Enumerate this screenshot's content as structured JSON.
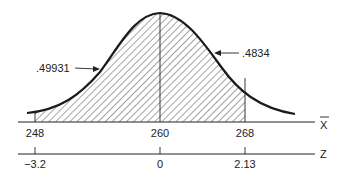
{
  "diagram": {
    "type": "normal-distribution",
    "curve_color": "#1a1a1a",
    "hatch_color": "#333333",
    "annotations": {
      "left_area": ".49931",
      "right_area": ".4834"
    },
    "x_axis": {
      "label": "X",
      "label_has_bar": true,
      "ticks": [
        {
          "value": "248",
          "pos": 35
        },
        {
          "value": "260",
          "pos": 160
        },
        {
          "value": "268",
          "pos": 245
        }
      ]
    },
    "z_axis": {
      "label": "Z",
      "ticks": [
        {
          "value": "−3.2",
          "pos": 35
        },
        {
          "value": "0",
          "pos": 160
        },
        {
          "value": "2.13",
          "pos": 245
        }
      ]
    },
    "shaded_region": {
      "from": "248",
      "to": "268"
    }
  }
}
